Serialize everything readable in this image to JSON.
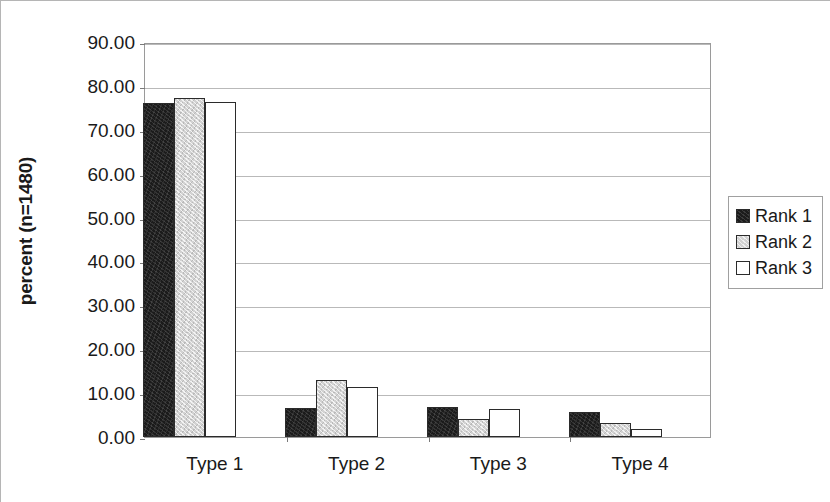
{
  "chart_data": {
    "type": "bar",
    "title": "",
    "xlabel": "",
    "ylabel": "percent (n=1480)",
    "categories": [
      "Type 1",
      "Type 2",
      "Type 3",
      "Type 4"
    ],
    "series": [
      {
        "name": "Rank 1",
        "color": "#1b1b1b",
        "values": [
          76.1,
          6.7,
          6.9,
          5.6
        ]
      },
      {
        "name": "Rank 2",
        "color": "#d2d2d2",
        "values": [
          77.3,
          12.9,
          4.2,
          3.2
        ]
      },
      {
        "name": "Rank 3",
        "color": "#ffffff",
        "values": [
          76.4,
          11.5,
          6.4,
          1.9
        ]
      }
    ],
    "ylim": [
      0,
      90
    ],
    "ytick_step": 10,
    "ytick_labels": [
      "90.00",
      "80.00",
      "70.00",
      "60.00",
      "50.00",
      "40.00",
      "30.00",
      "20.00",
      "10.00",
      "0.00"
    ],
    "ytick_values": [
      90,
      80,
      70,
      60,
      50,
      40,
      30,
      20,
      10,
      0
    ],
    "grid": true,
    "legend_position": "right",
    "legend_entries": [
      "Rank 1",
      "Rank 2",
      "Rank 3"
    ]
  }
}
